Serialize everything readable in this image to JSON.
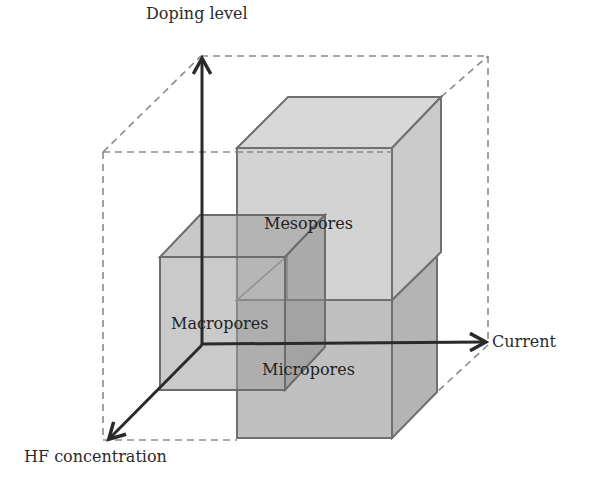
{
  "diagram": {
    "type": "3d-parameter-space",
    "axes": {
      "y": {
        "label": "Doping level"
      },
      "x": {
        "label": "Current"
      },
      "z": {
        "label": "HF concentration"
      }
    },
    "regions": [
      {
        "id": "mesopores",
        "label": "Mesopores",
        "fill": "#d4d4d4",
        "position": "upper, high doping, high current"
      },
      {
        "id": "micropores",
        "label": "Micropores",
        "fill": "#bdbdbd",
        "position": "lower, low doping, high current"
      },
      {
        "id": "macropores",
        "label": "Macropores",
        "fill": "#9e9e9e",
        "position": "low doping, low current, high HF"
      }
    ],
    "colors": {
      "axis": "#2a2a2a",
      "edge": "#707070",
      "dashed": "#8a8a8a"
    }
  }
}
